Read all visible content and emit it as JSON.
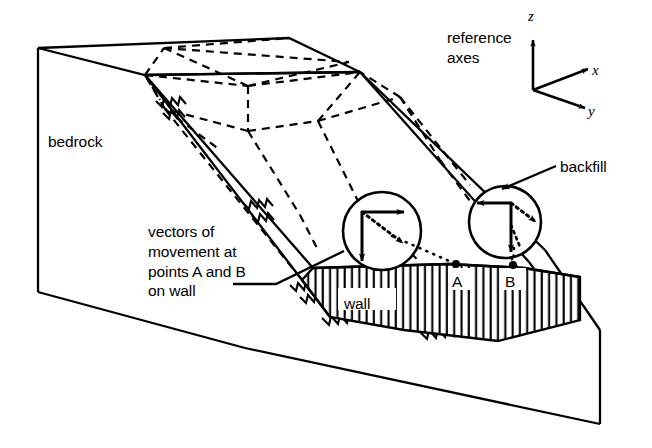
{
  "figure": {
    "background_color": "#ffffff",
    "line_color": "#000000",
    "width": 652,
    "height": 448
  },
  "labels": {
    "bedrock": "bedrock",
    "reference_axes": "reference\naxes",
    "backfill": "backfill",
    "vectors_note": "vectors of\nmovement at\npoints A and B\non wall",
    "wall": "wall",
    "point_a": "A",
    "point_b": "B"
  },
  "axes": {
    "z": "z",
    "x": "x",
    "y": "y",
    "z_direction": "up",
    "x_direction": "right",
    "y_direction": "down-right"
  },
  "vector_circles": [
    {
      "name": "vector-circle-a",
      "point": "A",
      "components": [
        "horizontal",
        "vertical",
        "resultant"
      ],
      "resultant_style": "dotted"
    },
    {
      "name": "vector-circle-b",
      "point": "B",
      "components": [
        "horizontal",
        "vertical",
        "resultant"
      ],
      "resultant_style": "dotted"
    }
  ],
  "features": {
    "wall_hatching": "vertical-lines",
    "bedrock_contact": "zigzag-hatch",
    "failure_surface": "dashed-lines"
  }
}
